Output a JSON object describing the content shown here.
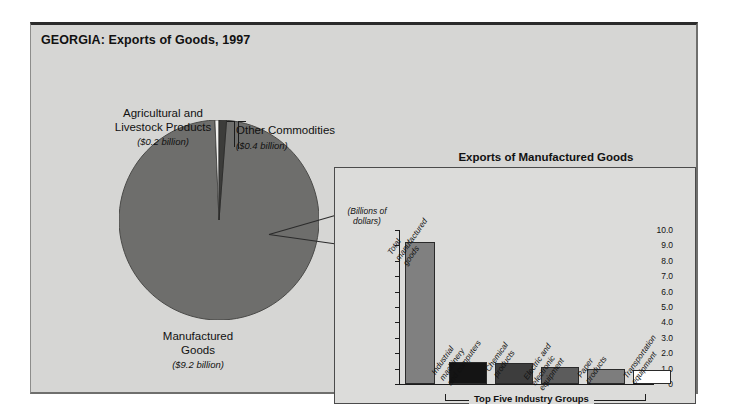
{
  "figure": {
    "title": "GEORGIA: Exports of Goods, 1997"
  },
  "pie": {
    "slices": [
      {
        "label": "Manufactured\nGoods",
        "label_line1": "Manufactured",
        "label_line2": "Goods",
        "amount": "($9.2 billion)",
        "value": 9.2,
        "color": "#6e6e6c"
      },
      {
        "label": "Agricultural and Livestock Products",
        "label_line1": "Agricultural and",
        "label_line2": "Livestock Products",
        "amount": "($0.2 billion)",
        "value": 0.2,
        "color": "#f2f2f0"
      },
      {
        "label": "Other Commodities",
        "label_line1": "Other Commodities",
        "label_line2": "",
        "amount": "($0.4 billion)",
        "value": 0.4,
        "color": "#3c3c3a"
      }
    ]
  },
  "inset": {
    "title": "Exports of Manufactured Goods",
    "axis_caption_line1": "(Billions of",
    "axis_caption_line2": "dollars)",
    "bracket_label": "Top Five Industry Groups"
  },
  "chart_data": {
    "type": "bar",
    "title": "Exports of Manufactured Goods",
    "xlabel": "",
    "ylabel": "(Billions of dollars)",
    "ylim": [
      0,
      10
    ],
    "yticks": [
      "0",
      "1.0",
      "2.0",
      "3.0",
      "4.0",
      "5.0",
      "6.0",
      "7.0",
      "8.0",
      "9.0",
      "10.0"
    ],
    "grid": false,
    "legend": "none",
    "categories": [
      "Total manufactured goods",
      "Industrial machinery and computers",
      "Chemical products",
      "Electric and electronic equipment",
      "Paper products",
      "Transportation equipment"
    ],
    "category_lines": [
      [
        "Total",
        "manufactured",
        "goods"
      ],
      [
        "Industrial",
        "machinery",
        "and computers"
      ],
      [
        "Chemical",
        "products"
      ],
      [
        "Electric and",
        "electronic",
        "equipment"
      ],
      [
        "Paper",
        "products"
      ],
      [
        "Transportation",
        "equipment"
      ]
    ],
    "values": [
      9.2,
      1.45,
      1.35,
      1.12,
      0.95,
      0.9
    ],
    "colors": [
      "#808080",
      "#141414",
      "#3d3d3d",
      "#5c5c5c",
      "#7d7d7d",
      "#ffffff"
    ],
    "annotation": "Top Five Industry Groups"
  },
  "pie_chart_data": {
    "type": "pie",
    "title": "GEORGIA: Exports of Goods, 1997",
    "labels": [
      "Manufactured Goods",
      "Agricultural and Livestock Products",
      "Other Commodities"
    ],
    "values": [
      9.2,
      0.2,
      0.4
    ],
    "unit": "billions of dollars",
    "colors": [
      "#6e6e6c",
      "#f2f2f0",
      "#3c3c3a"
    ]
  }
}
